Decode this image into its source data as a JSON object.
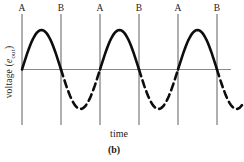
{
  "figure": {
    "caption": "(b)",
    "xlabel": "time",
    "ylabel": {
      "prefix": "voltage (",
      "symbol": "e",
      "subscript": "out",
      "suffix": ")"
    }
  },
  "colors": {
    "curve": "#0d0d0d",
    "axis_line": "#8a8a8a",
    "marker_line": "#5f5f5f",
    "text": "#1b1b1b",
    "background": "#ffffff"
  },
  "chart_data": {
    "type": "line",
    "title": "",
    "xlabel": "time",
    "ylabel": "voltage (e_out)",
    "grid": false,
    "x_unit": "periods of the input sine wave",
    "ylim": [
      -1.15,
      1.45
    ],
    "markers": [
      {
        "label": "A",
        "t": 0.0
      },
      {
        "label": "B",
        "t": 0.5
      },
      {
        "label": "A",
        "t": 1.0
      },
      {
        "label": "B",
        "t": 1.5
      },
      {
        "label": "A",
        "t": 2.0
      },
      {
        "label": "B",
        "t": 2.5
      }
    ],
    "series": [
      {
        "name": "positive half-cycles",
        "style": "solid",
        "function": "v = sin(2*pi*t)",
        "amplitude": 1,
        "segments_t": [
          [
            0.0,
            0.5
          ],
          [
            1.0,
            1.5
          ],
          [
            2.0,
            2.5
          ]
        ]
      },
      {
        "name": "negative half-cycles",
        "style": "dashed",
        "function": "v = sin(2*pi*t)",
        "amplitude": 1,
        "segments_t": [
          [
            0.5,
            1.0
          ],
          [
            1.5,
            2.0
          ],
          [
            2.5,
            2.82
          ]
        ]
      }
    ],
    "key_points": [
      {
        "t": 0.0,
        "v": 0
      },
      {
        "t": 0.25,
        "v": 1
      },
      {
        "t": 0.5,
        "v": 0
      },
      {
        "t": 0.75,
        "v": -1
      },
      {
        "t": 1.0,
        "v": 0
      },
      {
        "t": 1.25,
        "v": 1
      },
      {
        "t": 1.5,
        "v": 0
      },
      {
        "t": 1.75,
        "v": -1
      },
      {
        "t": 2.0,
        "v": 0
      },
      {
        "t": 2.25,
        "v": 1
      },
      {
        "t": 2.5,
        "v": 0
      },
      {
        "t": 2.82,
        "v": -0.93
      }
    ]
  }
}
